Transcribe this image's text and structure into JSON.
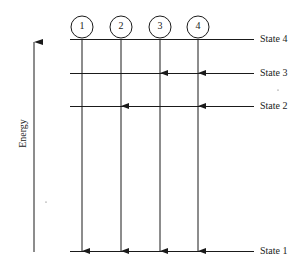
{
  "diagram": {
    "type": "energy-level-diagram",
    "axis_label": "Energy",
    "states": [
      {
        "id": 4,
        "label": "State 4",
        "y": 40
      },
      {
        "id": 3,
        "label": "State 3",
        "y": 73
      },
      {
        "id": 2,
        "label": "State 2",
        "y": 106
      },
      {
        "id": 1,
        "label": "State 1",
        "y": 252
      }
    ],
    "paths": [
      {
        "label": "1",
        "x": 82,
        "transitions": [
          "State 4 → State 1"
        ]
      },
      {
        "label": "2",
        "x": 121,
        "transitions": [
          "State 4 → State 2",
          "State 2 → State 1"
        ]
      },
      {
        "label": "3",
        "x": 160,
        "transitions": [
          "State 4 → State 3",
          "State 3 → State 1"
        ]
      },
      {
        "label": "4",
        "x": 198,
        "transitions": [
          "State 4 → State 3",
          "State 3 → State 2",
          "State 2 → State 1"
        ]
      }
    ],
    "colors": {
      "line": "#1a1a1a",
      "text": "#222222",
      "background": "#ffffff"
    }
  }
}
